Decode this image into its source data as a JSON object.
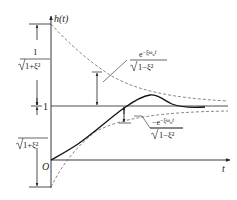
{
  "diagram": {
    "y_axis_label": "h(t)",
    "x_axis_label": "t",
    "origin_label": "O",
    "steady_state_label": "1",
    "upper_dimension_label": {
      "numerator": "1",
      "denominator": "1+ξ²"
    },
    "lower_dimension_label": {
      "numerator": "1",
      "denominator": "1+ξ²"
    },
    "upper_envelope_label": {
      "numerator": "e^{-ξω_n t}",
      "numerator_base": "e",
      "numerator_exp": "−ξω",
      "numerator_sub": "n",
      "numerator_t": "t",
      "denominator": "1−ξ²"
    },
    "lower_envelope_label": {
      "numerator_base": "−e",
      "numerator_exp": "−ξω",
      "numerator_sub": "n",
      "numerator_t": "t",
      "denominator": "1−ξ²"
    },
    "colors": {
      "line": "#222222",
      "dashed": "#555555",
      "background": "#ffffff"
    }
  }
}
